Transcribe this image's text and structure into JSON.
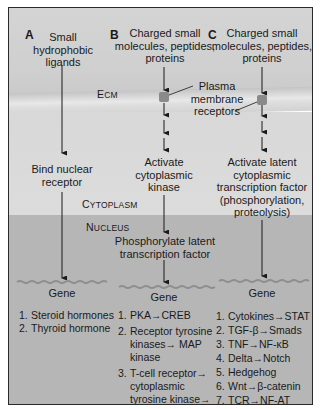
{
  "panels": {
    "A": {
      "label": "A",
      "input": "Small\nhydrophobic\nligands",
      "step1": "Bind nuclear\nreceptor",
      "gene": "Gene",
      "examples": [
        {
          "num": "1.",
          "text": "Steroid hormones"
        },
        {
          "num": "2.",
          "text": "Thyroid hormone"
        }
      ]
    },
    "B": {
      "label": "B",
      "input": "Charged small\nmolecules, peptides,\nproteins",
      "step1": "Activate\ncytoplasmic\nkinase",
      "step2": "Phosphorylate latent\ntranscription factor",
      "gene": "Gene",
      "examples": [
        {
          "num": "1.",
          "text": "PKA→CREB"
        },
        {
          "num": "2.",
          "text": "Receptor tyrosine kinases→ MAP kinase"
        },
        {
          "num": "3.",
          "text": "T-cell receptor→ cytoplasmic tyrosine kinase→"
        }
      ]
    },
    "C": {
      "label": "C",
      "input": "Charged small\nmolecules, peptides,\nproteins",
      "step1": "Activate latent\ncytoplasmic\ntranscription factor\n(phosphorylation,\nproteolysis)",
      "gene": "Gene",
      "examples": [
        {
          "num": "1.",
          "text": "Cytokines→STAT"
        },
        {
          "num": "2.",
          "text": "TGF-β→Smads"
        },
        {
          "num": "3.",
          "text": "TNF→NF-κB"
        },
        {
          "num": "4.",
          "text": "Delta→Notch"
        },
        {
          "num": "5.",
          "text": "Hedgehog"
        },
        {
          "num": "6.",
          "text": "Wnt→β-catenin"
        },
        {
          "num": "7.",
          "text": "TCR→NF-AT"
        }
      ]
    }
  },
  "regions": {
    "ecm": {
      "first": "E",
      "rest": "CM"
    },
    "cytoplasm": {
      "first": "C",
      "rest": "YTOPLASM"
    },
    "nucleus": {
      "first": "N",
      "rest": "UCLEUS"
    }
  },
  "callout": "Plasma\nmembrane\nreceptors",
  "colors": {
    "ecm_bg": "#d2d2d2",
    "cytoplasm_bg": "#dadada",
    "nucleus_bg": "#b6b6b6",
    "receptor": "#8a8a8a",
    "line": "#1a1a1a"
  }
}
